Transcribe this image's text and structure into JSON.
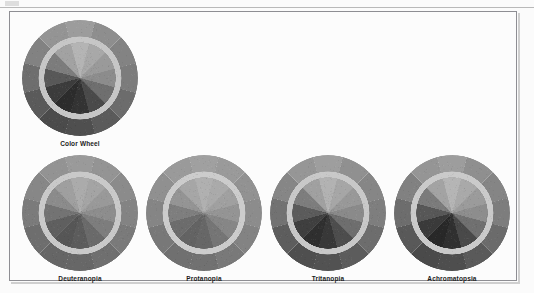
{
  "figure": {
    "background_color": "#fcfcfc",
    "frame_color": "#8e8e93",
    "caption_color": "#1b1b1b"
  },
  "artifact": {
    "top_rule_color": "#b9b9b9",
    "mark_color": "#d8d8d8"
  },
  "wheels": [
    {
      "id": "color-wheel",
      "label": "Color Wheel",
      "x": 22,
      "y": 20,
      "diameter": 116,
      "ring_color": "#c6c6c6",
      "outer_segments": [
        "#9c9c9c",
        "#8e8e8e",
        "#838383",
        "#7c7c7c",
        "#6c6c6c",
        "#5b5b5b",
        "#4f4f4f",
        "#4b4b4b",
        "#5a5a5a",
        "#6e6e6e",
        "#828282",
        "#949494"
      ],
      "inner_segments": [
        "#b4b4b4",
        "#a8a8a8",
        "#9a9a9a",
        "#8c8c8c",
        "#6f6f6f",
        "#4a4a4a",
        "#333333",
        "#2c2c2c",
        "#3c3c3c",
        "#585858",
        "#7c7c7c",
        "#a2a2a2"
      ]
    },
    {
      "id": "deuteranopia",
      "label": "Deuteranopia",
      "x": 22,
      "y": 155,
      "diameter": 116,
      "ring_color": "#c9c9c9",
      "outer_segments": [
        "#9a9a9a",
        "#949494",
        "#8b8b8b",
        "#838383",
        "#7a7a7a",
        "#6f6f6f",
        "#676767",
        "#666666",
        "#6e6e6e",
        "#7b7b7b",
        "#878787",
        "#939393"
      ],
      "inner_segments": [
        "#ababab",
        "#a4a4a4",
        "#999999",
        "#8d8d8d",
        "#7d7d7d",
        "#6a6a6a",
        "#5c5c5c",
        "#565656",
        "#5f5f5f",
        "#737373",
        "#8b8b8b",
        "#9f9f9f"
      ]
    },
    {
      "id": "protanopia",
      "label": "Protanopia",
      "x": 146,
      "y": 155,
      "diameter": 116,
      "ring_color": "#cccccc",
      "outer_segments": [
        "#a0a0a0",
        "#9a9a9a",
        "#929292",
        "#8c8c8c",
        "#838383",
        "#797979",
        "#717171",
        "#707070",
        "#787878",
        "#858585",
        "#909090",
        "#9a9a9a"
      ],
      "inner_segments": [
        "#b0b0b0",
        "#aaaaaa",
        "#a0a0a0",
        "#949494",
        "#868686",
        "#757575",
        "#676767",
        "#636363",
        "#6c6c6c",
        "#7e7e7e",
        "#949494",
        "#a6a6a6"
      ]
    },
    {
      "id": "tritanopia",
      "label": "Tritanopia",
      "x": 270,
      "y": 155,
      "diameter": 116,
      "ring_color": "#c8c8c8",
      "outer_segments": [
        "#9e9e9e",
        "#909090",
        "#868686",
        "#7e7e7e",
        "#6d6d6d",
        "#5c5c5c",
        "#525252",
        "#4f4f4f",
        "#5d5d5d",
        "#727272",
        "#868686",
        "#969696"
      ],
      "inner_segments": [
        "#b2b2b2",
        "#a6a6a6",
        "#989898",
        "#8a8a8a",
        "#6e6e6e",
        "#4d4d4d",
        "#383838",
        "#2f2f2f",
        "#3f3f3f",
        "#5b5b5b",
        "#7d7d7d",
        "#a0a0a0"
      ]
    },
    {
      "id": "achromatopsia",
      "label": "Achromatopsia",
      "x": 394,
      "y": 155,
      "diameter": 116,
      "ring_color": "#cacaca",
      "outer_segments": [
        "#9d9d9d",
        "#8f8f8f",
        "#858585",
        "#7d7d7d",
        "#6b6b6b",
        "#5a5a5a",
        "#4e4e4e",
        "#4a4a4a",
        "#595959",
        "#6d6d6d",
        "#818181",
        "#959595"
      ],
      "inner_segments": [
        "#b5b5b5",
        "#a9a9a9",
        "#9b9b9b",
        "#8d8d8d",
        "#707070",
        "#494949",
        "#303030",
        "#282828",
        "#3a3a3a",
        "#575757",
        "#7b7b7b",
        "#a3a3a3"
      ]
    }
  ]
}
